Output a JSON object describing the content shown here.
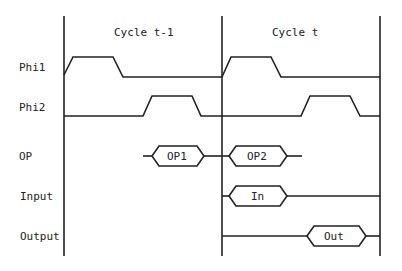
{
  "diagram": {
    "type": "timing-diagram",
    "cycles": [
      {
        "label": "Cycle t-1"
      },
      {
        "label": "Cycle t"
      }
    ],
    "signals": [
      {
        "label": "Phi1",
        "kind": "clock"
      },
      {
        "label": "Phi2",
        "kind": "clock"
      },
      {
        "label": "OP",
        "kind": "bus",
        "values": [
          "OP1",
          "OP2"
        ]
      },
      {
        "label": "Input",
        "kind": "bus",
        "values": [
          "In"
        ]
      },
      {
        "label": "Output",
        "kind": "bus",
        "values": [
          "Out"
        ]
      }
    ],
    "colors": {
      "stroke": "#222222",
      "background": "#ffffff"
    }
  }
}
